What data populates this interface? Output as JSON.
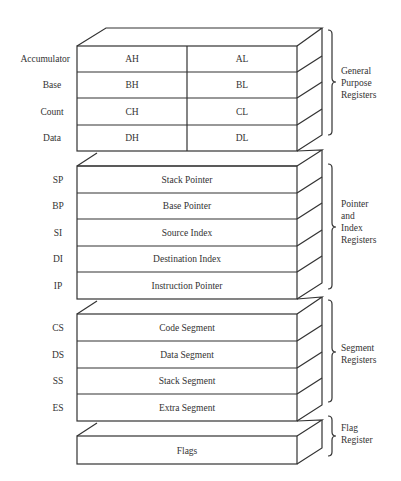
{
  "diagram": {
    "groups": [
      {
        "name": "General Purpose Registers",
        "label_lines": [
          "General",
          "Purpose",
          "Registers"
        ],
        "rows": [
          {
            "name": "Accumulator",
            "high": "AH",
            "low": "AL"
          },
          {
            "name": "Base",
            "high": "BH",
            "low": "BL"
          },
          {
            "name": "Count",
            "high": "CH",
            "low": "CL"
          },
          {
            "name": "Data",
            "high": "DH",
            "low": "DL"
          }
        ]
      },
      {
        "name": "Pointer and Index Registers",
        "label_lines": [
          "Pointer",
          "and",
          "Index",
          "Registers"
        ],
        "rows": [
          {
            "name": "SP",
            "value": "Stack Pointer"
          },
          {
            "name": "BP",
            "value": "Base Pointer"
          },
          {
            "name": "SI",
            "value": "Source Index"
          },
          {
            "name": "DI",
            "value": "Destination Index"
          },
          {
            "name": "IP",
            "value": "Instruction Pointer"
          }
        ]
      },
      {
        "name": "Segment Registers",
        "label_lines": [
          "Segment",
          "Registers"
        ],
        "rows": [
          {
            "name": "CS",
            "value": "Code Segment"
          },
          {
            "name": "DS",
            "value": "Data Segment"
          },
          {
            "name": "SS",
            "value": "Stack Segment"
          },
          {
            "name": "ES",
            "value": "Extra Segment"
          }
        ]
      },
      {
        "name": "Flag Register",
        "label_lines": [
          "Flag",
          "Register"
        ],
        "rows": [
          {
            "name": "",
            "value": "Flags"
          }
        ]
      }
    ]
  }
}
